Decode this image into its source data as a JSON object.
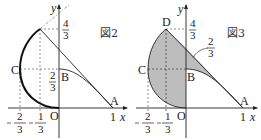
{
  "figure2": {
    "title": "図2",
    "axis_x": "x",
    "axis_y": "y",
    "points": {
      "A": "A",
      "B": "B",
      "C": "C",
      "O": "O"
    },
    "tick_x_1": "1",
    "frac_y_top": {
      "num": "4",
      "den": "3"
    },
    "frac_y_mid": {
      "num": "2",
      "den": "3"
    },
    "frac_x_a": {
      "num": "2",
      "den": "3",
      "sign": "−"
    },
    "frac_x_b": {
      "num": "1",
      "den": "3",
      "sign": "−"
    }
  },
  "figure3": {
    "title": "図3",
    "axis_x": "x",
    "axis_y": "y",
    "points": {
      "A": "A",
      "B": "B",
      "C": "C",
      "D": "D",
      "O": "O"
    },
    "tick_x_1": "1",
    "frac_y_top": {
      "num": "4",
      "den": "3"
    },
    "frac_annot": {
      "num": "2",
      "den": "3"
    },
    "frac_x_a": {
      "num": "2",
      "den": "3",
      "sign": "−"
    },
    "frac_x_b": {
      "num": "1",
      "den": "3",
      "sign": "−"
    }
  },
  "colors": {
    "line": "#222222",
    "shade": "#bdbdbd"
  }
}
